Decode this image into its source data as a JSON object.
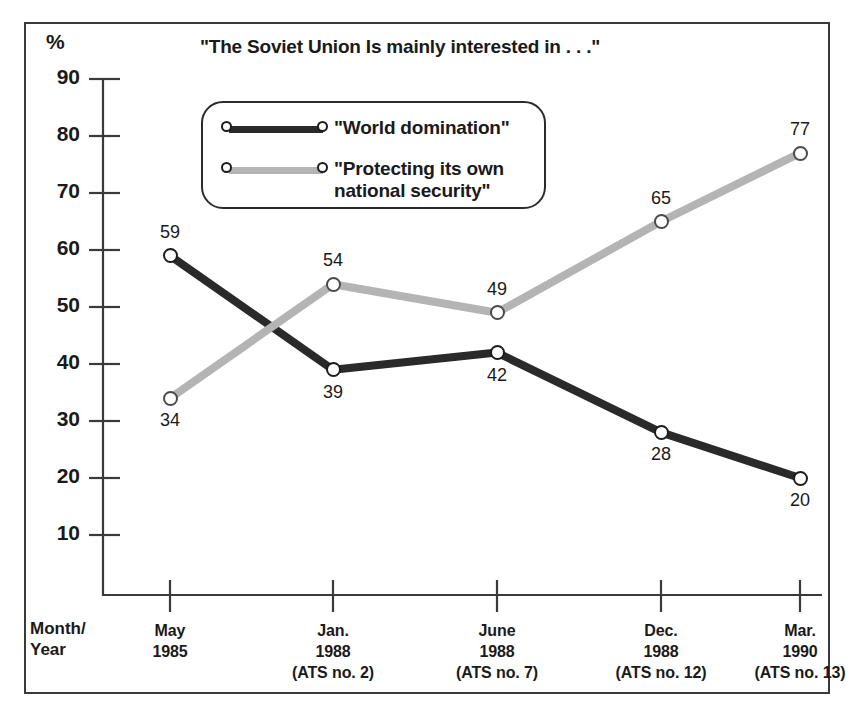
{
  "chart_data": {
    "type": "line",
    "title": "\"The Soviet Union Is mainly interested in . . .\"",
    "ylabel": "%",
    "xlabel": "Month/\nYear",
    "ylim": [
      0,
      95
    ],
    "yticks": [
      90,
      80,
      70,
      60,
      50,
      40,
      30,
      20,
      10
    ],
    "grid": false,
    "legend_position": "upper-left-inside",
    "categories": [
      "May\n1985",
      "Jan.\n1988\n(ATS no. 2)",
      "June\n1988\n(ATS no. 7)",
      "Dec.\n1988\n(ATS no. 12)",
      "Mar.\n1990\n(ATS no. 13)"
    ],
    "series": [
      {
        "name": "\"World domination\"",
        "color": "#2a2a2a",
        "values": [
          59,
          39,
          42,
          28,
          20
        ],
        "label_positions": [
          "above",
          "below",
          "below",
          "below",
          "below"
        ]
      },
      {
        "name": "\"Protecting its own\nnational security\"",
        "color": "#b4b4b4",
        "values": [
          34,
          54,
          49,
          65,
          77
        ],
        "label_positions": [
          "below",
          "above",
          "above",
          "above",
          "above"
        ]
      }
    ]
  },
  "axis": {
    "y_unit_label": "%",
    "x_axis_caption": "Month/\nYear",
    "tick_labels_y": [
      "90",
      "80",
      "70",
      "60",
      "50",
      "40",
      "30",
      "20",
      "10"
    ]
  },
  "legend": {
    "entries": [
      {
        "label": "\"World domination\"",
        "color": "#2a2a2a"
      },
      {
        "label": "\"Protecting its own\nnational security\"",
        "color": "#b4b4b4"
      }
    ]
  },
  "colors": {
    "series_dark": "#2a2a2a",
    "series_light": "#b4b4b4",
    "frame": "#3a3a3a",
    "text": "#1a1a1a",
    "background": "#ffffff"
  }
}
